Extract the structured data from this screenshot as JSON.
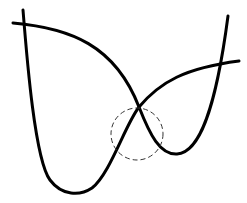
{
  "diagram": {
    "colors": {
      "stroke": "#000000",
      "background": "#ffffff"
    },
    "curves": [
      {
        "name": "curve-a",
        "path": "M23,10 C27,60 35,160 50,180 C62,196 80,196 92,188 C110,174 125,125 139,107 C160,82 185,68 239,61"
      },
      {
        "name": "curve-b",
        "path": "M13,23 C70,28 115,45 139,107 C150,135 160,155 177,154 C198,153 215,115 228,16"
      }
    ],
    "highlight_circle": {
      "cx": 137,
      "cy": 134,
      "r": 26,
      "dash": "5,3"
    }
  }
}
